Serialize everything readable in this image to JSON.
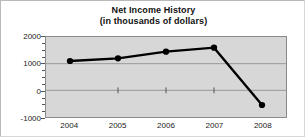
{
  "chart_data": {
    "type": "line",
    "title": "Net Income History",
    "subtitle": "(in thousands of dollars)",
    "xlabel": "",
    "ylabel": "",
    "categories": [
      "2004",
      "2005",
      "2006",
      "2007",
      "2008"
    ],
    "values": [
      1100,
      1200,
      1450,
      1600,
      -550
    ],
    "series": [
      {
        "name": "Net Income",
        "values": [
          1100,
          1200,
          1450,
          1600,
          -550
        ]
      }
    ],
    "ylim": [
      -1000,
      2000
    ],
    "ytick_labels": [
      "2000",
      "1000",
      "0",
      "-1000"
    ],
    "ytick_values": [
      2000,
      1000,
      0,
      -1000
    ],
    "yminor_step": 250,
    "grid": true,
    "legend": false,
    "legend_position": "none",
    "marker": "filled-circle",
    "line_color": "#000000",
    "marker_color": "#000000",
    "plot_background": "#d7d7d7",
    "figure_background": "#ffffff",
    "gridline_color": "#9a9a9a"
  }
}
